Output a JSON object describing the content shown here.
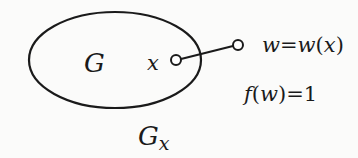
{
  "diagram": {
    "region": {
      "label": "G",
      "shape": "ellipse"
    },
    "inner_point": {
      "label": "x"
    },
    "outer_point": {
      "label": "w=w(x)",
      "label_parts": [
        "w",
        "=",
        "w",
        "(",
        "x",
        ")"
      ]
    },
    "condition": {
      "label": "f(w)=1",
      "text_func": "f",
      "text_paren_open": "(",
      "text_var": "w",
      "text_paren_close": ")",
      "text_eq": "=",
      "text_value": "1"
    },
    "boundary_label": {
      "base": "G",
      "subscript": "x"
    },
    "colors": {
      "stroke": "#1a1a1a",
      "background": "#fbfbfa"
    }
  }
}
